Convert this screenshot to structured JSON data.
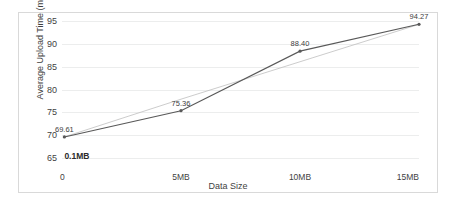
{
  "chart_data": {
    "type": "line",
    "title": "",
    "xlabel": "Data Size",
    "ylabel": "Average Upload Time (ms)",
    "x": [
      0.1,
      5,
      10,
      15
    ],
    "categories": [
      "0.1MB",
      "5MB",
      "10MB",
      "15MB"
    ],
    "series": [
      {
        "name": "Average Upload Time",
        "values": [
          69.61,
          75.36,
          88.4,
          94.27
        ],
        "color": "#595959",
        "markers": true,
        "labels": [
          "69.61",
          "75.36",
          "88.40",
          "94.27"
        ]
      },
      {
        "name": "Linear trendline",
        "values": [
          69.61,
          77.88,
          86.08,
          94.27
        ],
        "color": "#bfbfbf",
        "markers": false,
        "labels": []
      }
    ],
    "ylim": [
      65,
      95
    ],
    "yticks": [
      65,
      70,
      75,
      80,
      85,
      90,
      95
    ],
    "ytick_labels": [
      "65",
      "70",
      "75",
      "80",
      "85",
      "90",
      "95"
    ],
    "xlim": [
      0,
      15
    ],
    "xticks": [
      0,
      5,
      10,
      15
    ],
    "xtick_labels": [
      "0",
      "5MB",
      "10MB",
      "15MB"
    ],
    "grid": "horizontal",
    "legend": "none",
    "annotations": [
      {
        "text": "0.1MB",
        "x": 0.1,
        "y": 66.6
      }
    ]
  }
}
